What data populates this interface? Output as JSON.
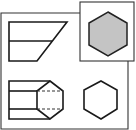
{
  "diagram": {
    "type": "orthographic-projection",
    "colors": {
      "line": "#1a1a1a",
      "frame": "#333333",
      "highlight_fill": "#c4c4c4",
      "background": "#ffffff"
    },
    "views": [
      {
        "name": "front-view",
        "shape": "trapezoid with horizontal midline"
      },
      {
        "name": "selected-top-view",
        "shape": "filled hexagon in highlighted box"
      },
      {
        "name": "plan-view",
        "shape": "rectangle joined to hexagon with dashed hidden lines"
      },
      {
        "name": "side-view",
        "shape": "outline hexagon"
      }
    ]
  }
}
